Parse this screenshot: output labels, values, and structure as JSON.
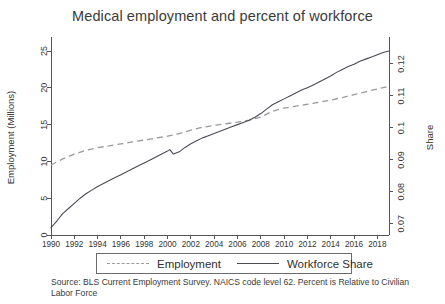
{
  "chart_data": {
    "type": "line",
    "title": "Medical employment and percent of workforce",
    "xlabel": "",
    "ylabel": "Employment (Millions)",
    "y2label": "Share",
    "xlim": [
      1990,
      2019
    ],
    "ylim": [
      0,
      26.5
    ],
    "y2lim": [
      0.0665,
      0.1275
    ],
    "grid": false,
    "legend_position": "bottom-center",
    "xticks": [
      1990,
      1992,
      1994,
      1996,
      1998,
      2000,
      2002,
      2004,
      2006,
      2008,
      2010,
      2012,
      2014,
      2016,
      2018
    ],
    "yticks": [
      0,
      5,
      10,
      15,
      20,
      25
    ],
    "y2ticks": [
      "0.07",
      "0.08",
      "0.09",
      "0.1",
      "0.11",
      "0.12"
    ],
    "footnote": "Source: BLS Current Employment Survey. NAICS code level 62. Percent is Relative to Civilian Labor Force",
    "series": [
      {
        "name": "Employment",
        "style": "dashed",
        "color": "#9a9a9a",
        "axis": "right",
        "units": "share",
        "x": [
          1990,
          1991,
          1992,
          1993,
          1994,
          1995,
          1996,
          1997,
          1998,
          1999,
          2000,
          2001,
          2002,
          2003,
          2004,
          2005,
          2006,
          2007,
          2008,
          2009,
          2010,
          2011,
          2012,
          2013,
          2014,
          2015,
          2016,
          2017,
          2018,
          2019
        ],
        "values": [
          0.0884,
          0.0903,
          0.0918,
          0.093,
          0.0938,
          0.0944,
          0.095,
          0.0956,
          0.0962,
          0.0968,
          0.0974,
          0.0982,
          0.0993,
          0.1002,
          0.1008,
          0.1013,
          0.1018,
          0.1024,
          0.1034,
          0.1052,
          0.1062,
          0.1068,
          0.1074,
          0.108,
          0.1087,
          0.1095,
          0.1104,
          0.1113,
          0.1122,
          0.113
        ]
      },
      {
        "name": "Workforce Share",
        "style": "solid",
        "color": "#4a4a55",
        "axis": "left",
        "units": "millions",
        "x": [
          1990,
          1990.5,
          1991,
          1991.5,
          1992,
          1992.5,
          1993,
          1993.5,
          1994,
          1994.5,
          1995,
          1995.5,
          1996,
          1996.5,
          1997,
          1997.5,
          1998,
          1998.5,
          1999,
          1999.5,
          2000,
          2000.2,
          2000.5,
          2001,
          2001.5,
          2002,
          2002.5,
          2003,
          2003.5,
          2004,
          2004.5,
          2005,
          2005.5,
          2006,
          2006.5,
          2007,
          2007.5,
          2008,
          2008.5,
          2009,
          2009.5,
          2010,
          2010.5,
          2011,
          2011.5,
          2012,
          2012.5,
          2013,
          2013.5,
          2014,
          2014.5,
          2015,
          2015.5,
          2016,
          2016.5,
          2017,
          2017.5,
          2018,
          2018.5,
          2019
        ],
        "values": [
          1.0,
          1.9,
          2.9,
          3.6,
          4.3,
          5.0,
          5.6,
          6.1,
          6.6,
          7.0,
          7.4,
          7.8,
          8.2,
          8.6,
          9.0,
          9.4,
          9.8,
          10.2,
          10.6,
          11.0,
          11.4,
          11.6,
          11.0,
          11.3,
          11.9,
          12.4,
          12.8,
          13.2,
          13.5,
          13.8,
          14.1,
          14.4,
          14.7,
          15.0,
          15.3,
          15.6,
          16.0,
          16.5,
          17.1,
          17.7,
          18.1,
          18.5,
          18.9,
          19.3,
          19.7,
          20.0,
          20.4,
          20.8,
          21.2,
          21.6,
          22.1,
          22.5,
          22.9,
          23.2,
          23.6,
          23.9,
          24.2,
          24.5,
          24.8,
          25.0
        ]
      }
    ]
  },
  "legend": {
    "entries": [
      {
        "label": "Employment",
        "style": "dashed"
      },
      {
        "label": "Workforce Share",
        "style": "solid"
      }
    ]
  }
}
